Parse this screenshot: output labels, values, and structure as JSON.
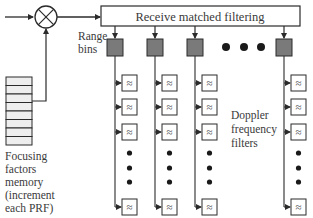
{
  "diagram": {
    "blocks": {
      "multiplier": {
        "symbol": "×"
      },
      "matched_filter": {
        "label": "Receive matched filtering"
      },
      "range_bins": {
        "label_line1": "Range",
        "label_line2": "bins",
        "count_shown": 4,
        "ellipsis": "• • •"
      },
      "doppler_filters": {
        "label_line1": "Doppler",
        "label_line2": "frequency",
        "label_line3": "filters",
        "glyph": "≈"
      },
      "focusing_memory": {
        "label_line1": "Focusing",
        "label_line2": "factors",
        "label_line3": "memory",
        "label_line4": "(increment",
        "label_line5": "each PRF)",
        "rows": 8
      }
    },
    "colors": {
      "line": "#2b2b2b",
      "range_bin_fill": "#7a7a7a",
      "memory_fill": "#eeeeee",
      "text": "#3a3a3a"
    }
  }
}
